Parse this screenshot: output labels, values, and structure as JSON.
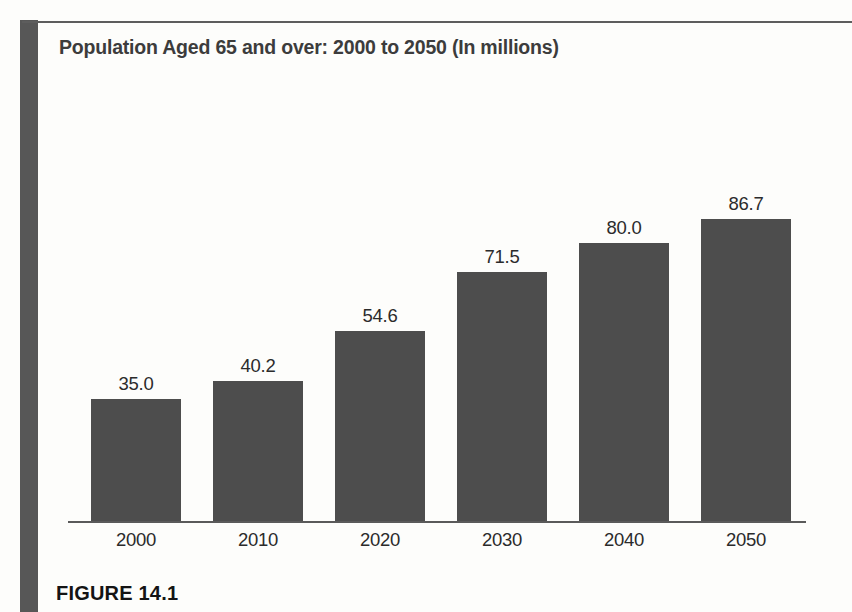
{
  "page": {
    "background_color": "#fdfdfb",
    "rule_color": "#575757"
  },
  "figure": {
    "caption": "FIGURE 14.1"
  },
  "chart_data": {
    "type": "bar",
    "title": "Population Aged 65 and over: 2000 to 2050 (In millions)",
    "xlabel": "",
    "ylabel": "",
    "categories": [
      "2000",
      "2010",
      "2020",
      "2030",
      "2040",
      "2050"
    ],
    "values": [
      35.0,
      40.2,
      54.6,
      71.5,
      80.0,
      86.7
    ],
    "value_labels": [
      "35.0",
      "40.2",
      "54.6",
      "71.5",
      "80.0",
      "86.7"
    ],
    "ylim": [
      0,
      100
    ],
    "grid": false,
    "legend": false,
    "bar_color": "#4d4d4d",
    "label_color": "#2b2b2b",
    "title_color": "#3c3c3c"
  }
}
